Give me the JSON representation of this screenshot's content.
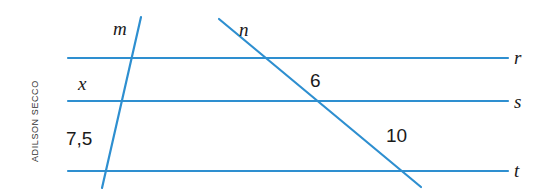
{
  "figure": {
    "kind": "geometry-diagram",
    "width": 547,
    "height": 190,
    "background_color": "#ffffff",
    "line_color": "#2e8fd0",
    "label_color": "#1a1a1a",
    "credit": "ADILSON SECCO",
    "parallel_lines": [
      {
        "id": "r",
        "label": "r",
        "y": 58,
        "x_start": 68,
        "x_end": 508,
        "label_x": 514,
        "label_y": 48
      },
      {
        "id": "s",
        "label": "s",
        "y": 101,
        "x_start": 68,
        "x_end": 508,
        "label_x": 514,
        "label_y": 92
      },
      {
        "id": "t",
        "label": "t",
        "y": 171,
        "x_start": 68,
        "x_end": 508,
        "label_x": 514,
        "label_y": 161
      }
    ],
    "transversals": [
      {
        "id": "m",
        "label": "m",
        "x1": 141,
        "y1": 17,
        "x2": 102,
        "y2": 188,
        "label_x": 113,
        "label_y": 19
      },
      {
        "id": "n",
        "label": "n",
        "x1": 219,
        "y1": 19,
        "x2": 421,
        "y2": 187,
        "label_x": 239,
        "label_y": 20
      }
    ],
    "measures": [
      {
        "id": "x",
        "text": "x",
        "style": "italic",
        "x": 78,
        "y": 74,
        "on_line": "m",
        "between": "r-s"
      },
      {
        "id": "75",
        "text": "7,5",
        "style": "number",
        "x": 66,
        "y": 129,
        "on_line": "m",
        "between": "s-t"
      },
      {
        "id": "6",
        "text": "6",
        "style": "number",
        "x": 310,
        "y": 71,
        "on_line": "n",
        "between": "r-s"
      },
      {
        "id": "10",
        "text": "10",
        "style": "number",
        "x": 386,
        "y": 126,
        "on_line": "n",
        "between": "s-t"
      }
    ]
  }
}
